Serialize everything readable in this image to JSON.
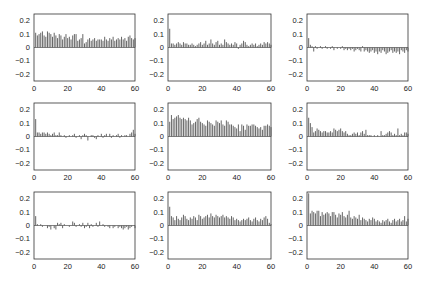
{
  "chart_data": [
    {
      "type": "bar",
      "title": "",
      "xlabel": "",
      "ylabel": "",
      "xlim": [
        0,
        60
      ],
      "ylim": [
        -0.25,
        0.25
      ],
      "xticks": [
        "0",
        "20",
        "40",
        "60"
      ],
      "yticks": [
        "0.2",
        "0.1",
        "0",
        "-0.1",
        "-0.2"
      ],
      "x_start": 1,
      "values": [
        0.11,
        0.09,
        0.1,
        0.11,
        0.12,
        0.09,
        0.08,
        0.12,
        0.11,
        0.1,
        0.08,
        0.11,
        0.09,
        0.07,
        0.1,
        0.09,
        0.06,
        0.08,
        0.1,
        0.07,
        0.08,
        0.06,
        0.09,
        0.1,
        0.1,
        0.05,
        0.06,
        0.07,
        0.1,
        0.03,
        0.04,
        0.06,
        0.07,
        0.05,
        0.06,
        0.07,
        0.05,
        0.06,
        0.06,
        0.06,
        0.05,
        0.08,
        0.06,
        0.05,
        0.07,
        0.06,
        0.08,
        0.05,
        0.06,
        0.07,
        0.06,
        0.08,
        0.06,
        0.07,
        0.05,
        0.08,
        0.09,
        0.07,
        0.06,
        0.07
      ]
    },
    {
      "type": "bar",
      "title": "",
      "xlabel": "",
      "ylabel": "",
      "xlim": [
        0,
        60
      ],
      "ylim": [
        -0.25,
        0.25
      ],
      "xticks": [
        "0",
        "20",
        "40",
        "60"
      ],
      "yticks": [
        "0.2",
        "0.1",
        "0",
        "-0.1",
        "-0.2"
      ],
      "x_start": 1,
      "values": [
        0.14,
        0.03,
        0.03,
        0.02,
        0.03,
        0.04,
        0.03,
        0.02,
        0.04,
        0.03,
        0.03,
        0.02,
        0.02,
        0.03,
        0.02,
        0.01,
        0.02,
        0.03,
        0.04,
        0.02,
        0.03,
        0.05,
        0.02,
        0.03,
        0.06,
        0.03,
        0.02,
        0.04,
        0.05,
        0.02,
        0.03,
        0.02,
        0.06,
        0.04,
        0.03,
        0.02,
        0.03,
        0.02,
        0.04,
        0.03,
        -0.01,
        0.02,
        0.03,
        0.05,
        0.04,
        0.02,
        0.01,
        0.02,
        0.03,
        0.02,
        0.03,
        0.01,
        0.02,
        0.03,
        0.02,
        0.04,
        0.03,
        0.04,
        0.03,
        0.02
      ]
    },
    {
      "type": "bar",
      "title": "",
      "xlabel": "",
      "ylabel": "",
      "xlim": [
        0,
        60
      ],
      "ylim": [
        -0.25,
        0.25
      ],
      "xticks": [
        "0",
        "20",
        "40",
        "60"
      ],
      "yticks": [
        "0.2",
        "0.1",
        "0",
        "-0.1",
        "-0.2"
      ],
      "x_start": 1,
      "values": [
        0.07,
        0.02,
        0.01,
        -0.03,
        0.01,
        -0.01,
        0.0,
        0.01,
        -0.01,
        0.0,
        0.01,
        -0.01,
        0.0,
        -0.01,
        0.01,
        -0.02,
        0.0,
        -0.01,
        0.0,
        -0.01,
        0.01,
        -0.02,
        -0.01,
        -0.02,
        -0.01,
        -0.02,
        -0.01,
        -0.03,
        -0.02,
        -0.01,
        -0.02,
        -0.03,
        0.01,
        -0.03,
        -0.02,
        -0.03,
        -0.04,
        -0.03,
        -0.02,
        -0.04,
        -0.03,
        -0.05,
        -0.03,
        -0.04,
        -0.02,
        -0.03,
        -0.05,
        -0.04,
        -0.03,
        -0.02,
        -0.04,
        -0.03,
        -0.04,
        -0.03,
        -0.05,
        -0.02,
        -0.03,
        -0.04,
        -0.02,
        -0.03
      ]
    },
    {
      "type": "bar",
      "title": "",
      "xlabel": "",
      "ylabel": "",
      "xlim": [
        0,
        60
      ],
      "ylim": [
        -0.25,
        0.25
      ],
      "xticks": [
        "0",
        "20",
        "40",
        "60"
      ],
      "yticks": [
        "0.2",
        "0.1",
        "0",
        "-0.1",
        "-0.2"
      ],
      "x_start": 1,
      "values": [
        0.13,
        0.03,
        0.03,
        0.02,
        0.03,
        0.03,
        0.02,
        0.03,
        0.02,
        0.01,
        0.02,
        0.03,
        0.01,
        0.01,
        0.03,
        0.01,
        0.0,
        0.01,
        -0.01,
        0.0,
        0.01,
        0.0,
        0.01,
        0.02,
        -0.01,
        0.0,
        0.01,
        -0.02,
        0.01,
        0.02,
        0.01,
        -0.03,
        0.0,
        0.01,
        0.01,
        -0.01,
        -0.02,
        0.01,
        0.0,
        0.02,
        -0.01,
        0.01,
        0.02,
        0.0,
        0.02,
        -0.01,
        0.01,
        0.0,
        0.01,
        0.02,
        -0.01,
        0.01,
        0.0,
        0.01,
        0.01,
        0.0,
        0.02,
        0.03,
        0.05,
        0.02
      ]
    },
    {
      "type": "bar",
      "title": "",
      "xlabel": "",
      "ylabel": "",
      "xlim": [
        0,
        60
      ],
      "ylim": [
        -0.25,
        0.25
      ],
      "xticks": [
        "0",
        "20",
        "40",
        "60"
      ],
      "yticks": [
        "0.2",
        "0.1",
        "0",
        "-0.1",
        "-0.2"
      ],
      "x_start": 1,
      "values": [
        0.11,
        0.16,
        0.13,
        0.14,
        0.15,
        0.16,
        0.14,
        0.13,
        0.14,
        0.13,
        0.12,
        0.14,
        0.12,
        0.09,
        0.1,
        0.11,
        0.13,
        0.14,
        0.11,
        0.1,
        0.09,
        0.08,
        0.12,
        0.11,
        0.1,
        0.09,
        0.08,
        0.12,
        0.11,
        0.1,
        0.12,
        0.09,
        0.08,
        0.12,
        0.11,
        0.09,
        0.09,
        0.08,
        0.07,
        0.06,
        0.09,
        0.04,
        0.09,
        0.08,
        0.05,
        0.09,
        0.08,
        0.08,
        0.09,
        0.09,
        0.08,
        0.07,
        0.06,
        0.07,
        0.05,
        0.08,
        0.08,
        0.09,
        0.08,
        0.07
      ]
    },
    {
      "type": "bar",
      "title": "",
      "xlabel": "",
      "ylabel": "",
      "xlim": [
        0,
        60
      ],
      "ylim": [
        -0.25,
        0.25
      ],
      "xticks": [
        "0",
        "20",
        "40",
        "60"
      ],
      "yticks": [
        "0.2",
        "0.1",
        "0",
        "-0.1",
        "-0.2"
      ],
      "x_start": 1,
      "values": [
        0.14,
        0.1,
        0.07,
        0.03,
        0.04,
        0.06,
        0.05,
        0.04,
        0.03,
        0.04,
        0.04,
        0.03,
        0.03,
        0.04,
        0.03,
        0.06,
        0.05,
        0.04,
        0.05,
        0.06,
        0.04,
        0.03,
        0.04,
        0.02,
        0.01,
        0.01,
        0.02,
        0.03,
        0.02,
        0.03,
        0.01,
        0.03,
        0.04,
        0.02,
        0.05,
        0.01,
        0.01,
        0.01,
        0.0,
        0.01,
        0.0,
        0.01,
        0.0,
        0.04,
        0.01,
        0.01,
        0.02,
        0.03,
        0.04,
        0.03,
        0.01,
        0.02,
        0.01,
        0.06,
        0.01,
        0.02,
        0.01,
        0.03,
        0.03,
        0.02
      ]
    },
    {
      "type": "bar",
      "title": "",
      "xlabel": "",
      "ylabel": "",
      "xlim": [
        0,
        60
      ],
      "ylim": [
        -0.25,
        0.25
      ],
      "xticks": [
        "0",
        "20",
        "40",
        "60"
      ],
      "yticks": [
        "0.2",
        "0.1",
        "0",
        "-0.1",
        "-0.2"
      ],
      "x_start": 1,
      "values": [
        0.07,
        0.01,
        0.0,
        0.01,
        -0.01,
        0.0,
        0.0,
        -0.02,
        -0.01,
        -0.03,
        0.0,
        -0.02,
        -0.03,
        0.02,
        0.01,
        0.02,
        -0.02,
        0.01,
        0.0,
        0.0,
        -0.01,
        0.0,
        0.03,
        0.02,
        -0.01,
        0.0,
        0.01,
        -0.01,
        0.02,
        -0.02,
        -0.01,
        0.02,
        -0.02,
        0.01,
        -0.01,
        0.0,
        0.02,
        -0.01,
        0.03,
        0.0,
        0.01,
        -0.01,
        0.0,
        -0.01,
        -0.02,
        0.0,
        -0.02,
        -0.01,
        0.0,
        -0.02,
        -0.01,
        -0.02,
        -0.03,
        -0.02,
        -0.01,
        -0.03,
        -0.02,
        -0.01,
        0.0,
        -0.02
      ]
    },
    {
      "type": "bar",
      "title": "",
      "xlabel": "",
      "ylabel": "",
      "xlim": [
        0,
        60
      ],
      "ylim": [
        -0.25,
        0.25
      ],
      "xticks": [
        "0",
        "20",
        "40",
        "60"
      ],
      "yticks": [
        "0.2",
        "0.1",
        "0",
        "-0.1",
        "-0.2"
      ],
      "x_start": 1,
      "values": [
        0.14,
        0.07,
        0.06,
        0.04,
        0.07,
        0.05,
        0.04,
        0.06,
        0.08,
        0.07,
        0.05,
        0.04,
        0.06,
        0.05,
        0.07,
        0.06,
        0.04,
        0.08,
        0.07,
        0.05,
        0.06,
        0.07,
        0.08,
        0.06,
        0.09,
        0.07,
        0.06,
        0.08,
        0.07,
        0.06,
        0.07,
        0.08,
        0.06,
        0.07,
        0.06,
        0.05,
        0.07,
        0.06,
        0.04,
        0.05,
        0.04,
        0.03,
        0.04,
        0.05,
        0.04,
        0.05,
        0.06,
        0.04,
        0.03,
        0.05,
        0.06,
        0.04,
        0.03,
        0.05,
        0.04,
        0.06,
        0.07,
        0.05,
        0.02,
        0.01
      ]
    },
    {
      "type": "bar",
      "title": "",
      "xlabel": "",
      "ylabel": "",
      "xlim": [
        0,
        60
      ],
      "ylim": [
        -0.25,
        0.25
      ],
      "xticks": [
        "0",
        "20",
        "40",
        "60"
      ],
      "yticks": [
        "0.2",
        "0.1",
        "0",
        "-0.1",
        "-0.2"
      ],
      "x_start": 1,
      "values": [
        0.24,
        0.09,
        0.11,
        0.1,
        0.09,
        0.11,
        0.11,
        0.07,
        0.1,
        0.08,
        0.09,
        0.1,
        0.09,
        0.07,
        0.1,
        0.1,
        0.08,
        0.06,
        0.09,
        0.08,
        0.1,
        0.07,
        0.06,
        0.08,
        0.11,
        0.06,
        0.05,
        0.07,
        0.06,
        0.05,
        0.08,
        0.04,
        0.06,
        0.05,
        0.04,
        0.03,
        0.05,
        0.04,
        0.06,
        0.05,
        0.03,
        0.04,
        0.03,
        0.02,
        0.04,
        0.03,
        0.04,
        0.05,
        0.03,
        0.02,
        0.04,
        0.05,
        0.03,
        0.04,
        0.05,
        0.03,
        0.04,
        0.07,
        0.03,
        0.05
      ]
    }
  ]
}
